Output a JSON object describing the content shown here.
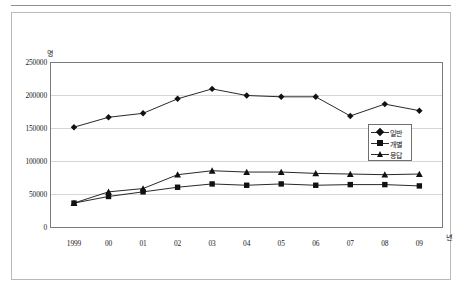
{
  "figure": {
    "y_unit_label": "명",
    "x_unit_label": "년"
  },
  "chart_data": {
    "type": "line",
    "title": "",
    "xlabel": "년",
    "ylabel": "명",
    "grid": true,
    "legend_position": "middle-right",
    "categories": [
      "1999",
      "00",
      "01",
      "02",
      "03",
      "04",
      "05",
      "06",
      "07",
      "08",
      "09"
    ],
    "ylim": [
      0,
      250000
    ],
    "ytick_labels": [
      "0",
      "50000",
      "100000",
      "150000",
      "200000",
      "250000"
    ],
    "yticks": [
      0,
      50000,
      100000,
      150000,
      200000,
      250000
    ],
    "series": [
      {
        "name": "일반",
        "marker": "diamond",
        "color": "#111111",
        "values": [
          152000,
          167000,
          173000,
          195000,
          210000,
          200000,
          198000,
          198000,
          169000,
          187000,
          177000
        ]
      },
      {
        "name": "개별",
        "marker": "square",
        "color": "#111111",
        "values": [
          37000,
          47000,
          54000,
          61000,
          66000,
          64000,
          66000,
          64000,
          65000,
          65000,
          63000
        ]
      },
      {
        "name": "응답",
        "marker": "triangle",
        "color": "#111111",
        "values": [
          37000,
          54000,
          59000,
          80000,
          86000,
          84000,
          84000,
          82000,
          81000,
          80000,
          81000
        ]
      }
    ]
  },
  "legend": {
    "items": [
      {
        "label": "일반",
        "marker": "diamond"
      },
      {
        "label": "개별",
        "marker": "square"
      },
      {
        "label": "응답",
        "marker": "triangle"
      }
    ]
  }
}
